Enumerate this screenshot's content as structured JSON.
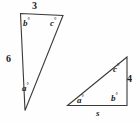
{
  "figure": {
    "stroke_color": "#3a3a3a",
    "text_color": "#1c1c1c",
    "background_color": "#ffffff",
    "left_triangle": {
      "name": "left-triangle",
      "top_side_label": "3",
      "left_side_label": "6",
      "angle_top_left": "b",
      "angle_top_right": "c",
      "angle_bottom_left": "a",
      "degree_symbol": "°"
    },
    "right_triangle": {
      "name": "right-triangle",
      "right_side_label": "4",
      "bottom_side_label": "s",
      "angle_bottom_left": "a",
      "angle_bottom_right": "b",
      "angle_top_right": "c",
      "degree_symbol": "°"
    }
  }
}
